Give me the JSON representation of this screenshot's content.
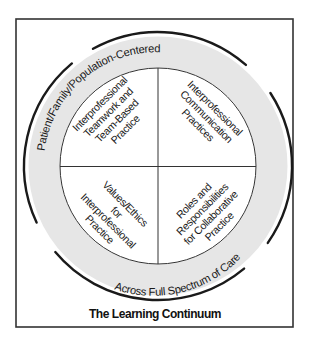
{
  "figure": {
    "title": "The Learning Continuum",
    "outer_ring": {
      "top_label": "Patient/Family/Population-Centered",
      "bottom_label": "Across Full Spectrum of Care"
    },
    "quadrants": {
      "top_left": {
        "lines": [
          "Interprofessional",
          "Teamwork and",
          "Team-Based",
          "Practice"
        ]
      },
      "top_right": {
        "lines": [
          "Interprofessional",
          "Communication",
          "Practices"
        ]
      },
      "bottom_left": {
        "lines": [
          "Values/Ethics",
          "for",
          "Interprofessional",
          "Practice"
        ]
      },
      "bottom_right": {
        "lines": [
          "Roles and",
          "Responsibilities",
          "for Collaborative",
          "Practice"
        ]
      }
    },
    "colors": {
      "band": "#e6e6e6",
      "stroke": "#1a1a1a",
      "frame": "#333333"
    }
  }
}
